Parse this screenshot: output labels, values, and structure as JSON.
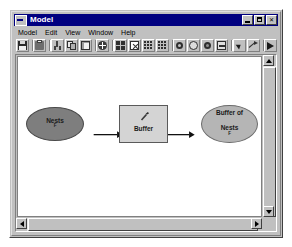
{
  "window": {
    "title": "Model",
    "title_icon": "model-document-icon",
    "controls": [
      {
        "name": "minimize-button",
        "glyph": "_"
      },
      {
        "name": "maximize-button",
        "glyph": "□"
      },
      {
        "name": "close-button",
        "glyph": "✕"
      }
    ]
  },
  "menubar": {
    "items": [
      {
        "label": "Model"
      },
      {
        "label": "Edit"
      },
      {
        "label": "View"
      },
      {
        "label": "Window"
      },
      {
        "label": "Help"
      }
    ]
  },
  "toolbar": {
    "groups": [
      {
        "buttons": [
          {
            "name": "save-button",
            "icon": "save-icon"
          }
        ]
      },
      {
        "buttons": [
          {
            "name": "print-button",
            "icon": "print-icon"
          }
        ]
      },
      {
        "buttons": [
          {
            "name": "cut-button",
            "icon": "scissors-icon"
          },
          {
            "name": "copy-button",
            "icon": "copy-icon"
          },
          {
            "name": "paste-button",
            "icon": "paste-icon"
          }
        ]
      },
      {
        "buttons": [
          {
            "name": "add-data-button",
            "icon": "add-circle-icon"
          }
        ]
      },
      {
        "buttons": [
          {
            "name": "auto-layout-button",
            "icon": "grid-layout-icon"
          },
          {
            "name": "validate-model-button",
            "icon": "box-x-icon"
          },
          {
            "name": "diagram-properties-button",
            "icon": "dots-grid-icon"
          },
          {
            "name": "model-report-button",
            "icon": "dots-grid-alt-icon"
          }
        ]
      },
      {
        "buttons": [
          {
            "name": "zoom-in-button",
            "icon": "magnifier-icon"
          },
          {
            "name": "pan-button",
            "icon": "pan-hand-icon"
          },
          {
            "name": "zoom-selected-button",
            "icon": "zoom-selected-icon"
          },
          {
            "name": "full-extent-button",
            "icon": "full-extent-icon"
          }
        ]
      },
      {
        "buttons": [
          {
            "name": "select-tool-button",
            "icon": "arrow-pointer-icon"
          },
          {
            "name": "connect-tool-button",
            "icon": "connect-arrow-icon"
          }
        ]
      },
      {
        "buttons": [
          {
            "name": "run-button",
            "icon": "play-run-icon"
          }
        ]
      }
    ]
  },
  "model": {
    "input": {
      "label": "Nests",
      "superscript": "F",
      "shape": "ellipse",
      "fill": "#7e7e7e"
    },
    "tool": {
      "label": "Buffer",
      "icon": "hammer-tool-icon",
      "shape": "rectangle",
      "fill": "#d4d4d4"
    },
    "output": {
      "label_line1": "Buffer of",
      "label_line2": "Nests",
      "superscript": "F",
      "shape": "ellipse",
      "fill": "#b5b5b5"
    },
    "connectors": [
      {
        "name": "connector-input-to-tool"
      },
      {
        "name": "connector-tool-to-output"
      }
    ]
  },
  "scrollbars": {
    "vertical": {
      "up": "▲",
      "down": "▼"
    },
    "horizontal": {
      "left": "◀",
      "right": "▶"
    }
  }
}
